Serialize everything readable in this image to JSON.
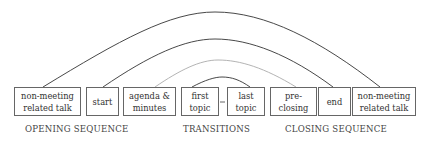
{
  "diagram": {
    "boxes": [
      {
        "id": "nm1",
        "text": "non-meeting related talk",
        "x": 14,
        "w": 67
      },
      {
        "id": "start",
        "text": "start",
        "x": 86,
        "w": 33
      },
      {
        "id": "agenda",
        "text": "agenda & minutes",
        "x": 123,
        "w": 53
      },
      {
        "id": "first",
        "text": "first topic",
        "x": 181,
        "w": 38
      },
      {
        "id": "last",
        "text": "last topic",
        "x": 227,
        "w": 38
      },
      {
        "id": "pre",
        "text": "pre- closing",
        "x": 270,
        "w": 47
      },
      {
        "id": "end",
        "text": "end",
        "x": 318,
        "w": 33
      },
      {
        "id": "nm2",
        "text": "non-meeting related talk",
        "x": 352,
        "w": 64
      }
    ],
    "sections": {
      "opening": "OPENING SEQUENCE",
      "transitions": "TRANSITIONS",
      "closing": "CLOSING SEQUENCE"
    },
    "connector": "-",
    "arcs": [
      {
        "from": "non-meeting related talk",
        "to": "non-meeting related talk",
        "color": "#333333"
      },
      {
        "from": "start",
        "to": "end",
        "color": "#333333"
      },
      {
        "from": "agenda & minutes",
        "to": "pre-closing",
        "color": "#aaaaaa"
      },
      {
        "from": "first topic",
        "to": "last topic",
        "color": "#333333"
      }
    ]
  }
}
